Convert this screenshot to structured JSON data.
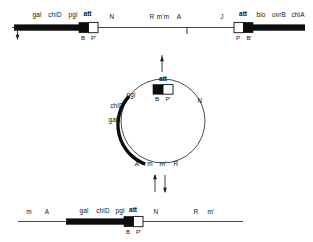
{
  "figure": {
    "colors": {
      "ink": "#0d0d0d",
      "line": "#2b2b2b",
      "background": "#ffffff"
    }
  },
  "top_panel": {
    "name": "bacterial-chromosome-with-prophage",
    "above_labels": [
      {
        "text": "gal",
        "x": 37,
        "y": 17
      },
      {
        "text": "chlD",
        "x": 55,
        "y": 17
      },
      {
        "text": "pgl",
        "x": 73,
        "y": 17
      },
      {
        "text": "att",
        "x": 87,
        "y": 16
      },
      {
        "text": "N",
        "x": 112,
        "y": 19
      },
      {
        "text": "R",
        "x": 152,
        "y": 19
      },
      {
        "text": "m'm",
        "x": 161,
        "y": 19
      },
      {
        "text": "A",
        "x": 178,
        "y": 19
      },
      {
        "text": "J",
        "x": 222,
        "y": 19
      },
      {
        "text": "att",
        "x": 239,
        "y": 16
      },
      {
        "text": "bio",
        "x": 255,
        "y": 17
      },
      {
        "text": "uvrB",
        "x": 273,
        "y": 17
      },
      {
        "text": "chlA",
        "x": 293,
        "y": 17
      }
    ],
    "below_labels": [
      {
        "text": "B",
        "x": 82,
        "y": 37
      },
      {
        "text": "P'",
        "x": 93,
        "y": 37
      },
      {
        "text": "P",
        "x": 238,
        "y": 37
      },
      {
        "text": "B'",
        "x": 249,
        "y": 37
      }
    ]
  },
  "middle_panel": {
    "name": "excised-circular-lambda-gal-element",
    "outside_labels": [
      {
        "text": "att",
        "x": 155,
        "y": 80
      },
      {
        "text": "pgl",
        "x": 124,
        "y": 95
      },
      {
        "text": "chlD",
        "x": 110,
        "y": 106
      },
      {
        "text": "gal",
        "x": 107,
        "y": 120
      },
      {
        "text": "N",
        "x": 196,
        "y": 101
      }
    ],
    "inside_labels": [
      {
        "text": "B",
        "x": 150,
        "y": 100
      },
      {
        "text": "P'",
        "x": 161,
        "y": 100
      }
    ],
    "bottom_labels": [
      {
        "text": "A",
        "x": 134,
        "y": 163
      },
      {
        "text": "m",
        "x": 147,
        "y": 163
      },
      {
        "text": "m'",
        "x": 159,
        "y": 163
      },
      {
        "text": "R",
        "x": 172,
        "y": 163
      }
    ]
  },
  "equilibrium": {
    "name": "reversible-reaction-arrows",
    "up_arrow": "integration",
    "down_arrow": "excision"
  },
  "bottom_panel": {
    "name": "integrated-prophage-chromosome",
    "above_labels": [
      {
        "text": "m",
        "x": 27,
        "y": 213
      },
      {
        "text": "A",
        "x": 45,
        "y": 213
      },
      {
        "text": "gal",
        "x": 82,
        "y": 212
      },
      {
        "text": "chlD",
        "x": 101,
        "y": 212
      },
      {
        "text": "pgl",
        "x": 120,
        "y": 212
      },
      {
        "text": "att",
        "x": 133,
        "y": 211
      },
      {
        "text": "N",
        "x": 155,
        "y": 213
      },
      {
        "text": "R",
        "x": 196,
        "y": 213
      },
      {
        "text": "m'",
        "x": 211,
        "y": 213
      }
    ],
    "below_labels": [
      {
        "text": "B",
        "x": 127,
        "y": 232
      },
      {
        "text": "P'",
        "x": 138,
        "y": 232
      }
    ]
  }
}
